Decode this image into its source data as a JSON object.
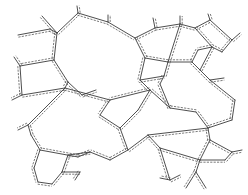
{
  "diagram": {
    "type": "polygonal-cell-network",
    "width": 248,
    "height": 195,
    "line_color": "#3a3a3a",
    "dash_color": "#5a5a5a",
    "background": "#ffffff",
    "offset": 2.2,
    "vertices": {
      "a": [
        18,
        35
      ],
      "b": [
        50,
        29
      ],
      "c": [
        42,
        16
      ],
      "d": [
        57,
        33
      ],
      "e": [
        78,
        13
      ],
      "e2": [
        77,
        6
      ],
      "f": [
        108,
        22
      ],
      "f2": [
        108,
        15
      ],
      "g": [
        135,
        38
      ],
      "h": [
        155,
        28
      ],
      "h2": [
        153,
        18
      ],
      "i": [
        180,
        24
      ],
      "i2": [
        180,
        16
      ],
      "j": [
        195,
        28
      ],
      "k": [
        210,
        20
      ],
      "k2": [
        208,
        14
      ],
      "l": [
        232,
        40
      ],
      "l2": [
        240,
        33
      ],
      "m": [
        222,
        52
      ],
      "n": [
        212,
        47
      ],
      "o": [
        198,
        50
      ],
      "p": [
        192,
        62
      ],
      "q": [
        168,
        62
      ],
      "r": [
        145,
        58
      ],
      "s": [
        54,
        60
      ],
      "t": [
        20,
        66
      ],
      "t2": [
        14,
        57
      ],
      "u": [
        68,
        82
      ],
      "v": [
        22,
        95
      ],
      "v2": [
        12,
        100
      ],
      "w": [
        65,
        88
      ],
      "x": [
        82,
        95
      ],
      "x2": [
        96,
        90
      ],
      "y": [
        140,
        80
      ],
      "z": [
        160,
        84
      ],
      "aa": [
        164,
        76
      ],
      "ab": [
        200,
        70
      ],
      "ac": [
        210,
        80
      ],
      "ad": [
        224,
        78
      ],
      "ae": [
        235,
        100
      ],
      "af": [
        232,
        120
      ],
      "ag": [
        208,
        128
      ],
      "ah": [
        196,
        112
      ],
      "ai": [
        170,
        108
      ],
      "aj": [
        150,
        90
      ],
      "ak": [
        110,
        100
      ],
      "al": [
        120,
        128
      ],
      "am": [
        128,
        150
      ],
      "an": [
        110,
        160
      ],
      "ao": [
        90,
        152
      ],
      "ap": [
        78,
        157
      ],
      "aq": [
        40,
        150
      ],
      "ar": [
        31,
        135
      ],
      "as": [
        28,
        125
      ],
      "at": [
        18,
        130
      ],
      "au": [
        34,
        168
      ],
      "av": [
        38,
        182
      ],
      "aw": [
        52,
        184
      ],
      "ax": [
        62,
        172
      ],
      "ay": [
        68,
        155
      ],
      "az": [
        80,
        172
      ],
      "ba": [
        75,
        180
      ],
      "bb": [
        148,
        135
      ],
      "bc": [
        160,
        148
      ],
      "bd": [
        170,
        180
      ],
      "be": [
        160,
        178
      ],
      "bf": [
        180,
        175
      ],
      "bg": [
        210,
        140
      ],
      "bh": [
        232,
        152
      ],
      "bi": [
        242,
        150
      ],
      "bj": [
        200,
        160
      ],
      "bk": [
        196,
        172
      ],
      "bl": [
        186,
        188
      ],
      "bm": [
        206,
        188
      ],
      "bn": [
        225,
        160
      ],
      "bo": [
        138,
        110
      ],
      "bp": [
        100,
        115
      ]
    },
    "edges": [
      [
        "a",
        "b"
      ],
      [
        "b",
        "d"
      ],
      [
        "c",
        "d"
      ],
      [
        "d",
        "e"
      ],
      [
        "e",
        "e2"
      ],
      [
        "e",
        "f"
      ],
      [
        "f",
        "f2"
      ],
      [
        "f",
        "g"
      ],
      [
        "g",
        "h"
      ],
      [
        "h",
        "h2"
      ],
      [
        "h",
        "i"
      ],
      [
        "i",
        "i2"
      ],
      [
        "i",
        "j"
      ],
      [
        "j",
        "k"
      ],
      [
        "k",
        "k2"
      ],
      [
        "k",
        "l"
      ],
      [
        "l",
        "l2"
      ],
      [
        "l",
        "m"
      ],
      [
        "m",
        "n"
      ],
      [
        "n",
        "j"
      ],
      [
        "n",
        "o"
      ],
      [
        "o",
        "p"
      ],
      [
        "p",
        "q"
      ],
      [
        "q",
        "r"
      ],
      [
        "r",
        "g"
      ],
      [
        "q",
        "i"
      ],
      [
        "d",
        "s"
      ],
      [
        "s",
        "t"
      ],
      [
        "t",
        "t2"
      ],
      [
        "s",
        "u"
      ],
      [
        "t",
        "v"
      ],
      [
        "v",
        "v2"
      ],
      [
        "v",
        "w"
      ],
      [
        "u",
        "w"
      ],
      [
        "u",
        "x"
      ],
      [
        "x",
        "x2"
      ],
      [
        "w",
        "ak"
      ],
      [
        "r",
        "y"
      ],
      [
        "y",
        "aa"
      ],
      [
        "aa",
        "q"
      ],
      [
        "aa",
        "z"
      ],
      [
        "y",
        "aj"
      ],
      [
        "z",
        "ai"
      ],
      [
        "p",
        "ab"
      ],
      [
        "ab",
        "ac"
      ],
      [
        "ac",
        "ad"
      ],
      [
        "ab",
        "n"
      ],
      [
        "ac",
        "ae"
      ],
      [
        "ae",
        "af"
      ],
      [
        "af",
        "ag"
      ],
      [
        "ag",
        "ah"
      ],
      [
        "ah",
        "ai"
      ],
      [
        "ai",
        "aj"
      ],
      [
        "aj",
        "ak"
      ],
      [
        "ak",
        "bp"
      ],
      [
        "bp",
        "al"
      ],
      [
        "al",
        "bo"
      ],
      [
        "bo",
        "aj"
      ],
      [
        "al",
        "am"
      ],
      [
        "am",
        "an"
      ],
      [
        "an",
        "ao"
      ],
      [
        "ao",
        "ap"
      ],
      [
        "ap",
        "aq"
      ],
      [
        "aq",
        "ar"
      ],
      [
        "ar",
        "as"
      ],
      [
        "as",
        "at"
      ],
      [
        "as",
        "w"
      ],
      [
        "aq",
        "au"
      ],
      [
        "au",
        "av"
      ],
      [
        "av",
        "aw"
      ],
      [
        "aw",
        "ax"
      ],
      [
        "ax",
        "ay"
      ],
      [
        "ay",
        "ao"
      ],
      [
        "ax",
        "az"
      ],
      [
        "az",
        "ba"
      ],
      [
        "am",
        "bb"
      ],
      [
        "bb",
        "bc"
      ],
      [
        "bc",
        "bd"
      ],
      [
        "bd",
        "be"
      ],
      [
        "bd",
        "bf"
      ],
      [
        "bb",
        "ag"
      ],
      [
        "ag",
        "bg"
      ],
      [
        "bg",
        "bh"
      ],
      [
        "bh",
        "bi"
      ],
      [
        "bg",
        "bj"
      ],
      [
        "bj",
        "bk"
      ],
      [
        "bk",
        "bl"
      ],
      [
        "bk",
        "bm"
      ],
      [
        "bj",
        "bn"
      ],
      [
        "bn",
        "bh"
      ],
      [
        "bc",
        "bj"
      ]
    ]
  }
}
